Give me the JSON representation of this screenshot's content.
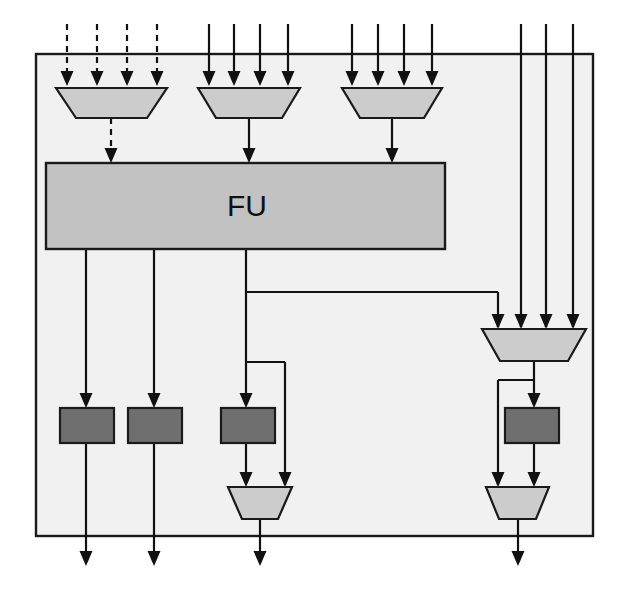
{
  "diagram": {
    "canvas": {
      "width": 626,
      "height": 590
    },
    "colors": {
      "background": "#ffffff",
      "frame_fill": "#f1f1f1",
      "frame_stroke": "#1a1a1a",
      "fu_fill": "#c2c2c2",
      "mux_fill": "#cccccc",
      "register_fill": "#6f6f6f",
      "wire": "#111111",
      "label_text": "#111111"
    },
    "frame": {
      "x": 36,
      "y": 54,
      "width": 557,
      "height": 482
    },
    "fu": {
      "label": "FU",
      "x": 46,
      "y": 163,
      "width": 399,
      "height": 86,
      "label_x": 247,
      "label_y": 208
    },
    "muxes": [
      {
        "name": "input-mux-1",
        "top_left": 56,
        "top_right": 167,
        "bottom_left": 76,
        "bottom_right": 147,
        "top_y": 88,
        "bottom_y": 118,
        "dashed": true,
        "inputs": [
          67,
          97,
          127,
          157
        ],
        "output_x": 111
      },
      {
        "name": "input-mux-2",
        "top_left": 198,
        "top_right": 300,
        "bottom_left": 216,
        "bottom_right": 282,
        "top_y": 88,
        "bottom_y": 118,
        "dashed": false,
        "inputs": [
          209,
          234,
          260,
          288
        ],
        "output_x": 249
      },
      {
        "name": "input-mux-3",
        "top_left": 342,
        "top_right": 442,
        "bottom_left": 360,
        "bottom_right": 424,
        "top_y": 88,
        "bottom_y": 118,
        "dashed": false,
        "inputs": [
          352,
          378,
          404,
          432
        ],
        "output_x": 392
      },
      {
        "name": "right-mux",
        "top_left": 482,
        "top_right": 586,
        "bottom_left": 500,
        "bottom_right": 568,
        "top_y": 329,
        "bottom_y": 361,
        "dashed": false,
        "inputs": [
          498,
          521,
          546,
          573
        ],
        "output_x": 534
      },
      {
        "name": "output-mux-center",
        "top_left": 228,
        "top_right": 292,
        "bottom_left": 242,
        "bottom_right": 278,
        "top_y": 487,
        "bottom_y": 519,
        "dashed": false,
        "inputs": [
          246,
          285
        ],
        "output_x": 260
      },
      {
        "name": "output-mux-right",
        "top_left": 486,
        "top_right": 549,
        "bottom_left": 499,
        "bottom_right": 536,
        "top_y": 487,
        "bottom_y": 519,
        "dashed": false,
        "inputs": [
          498,
          534
        ],
        "output_x": 518
      }
    ],
    "registers": [
      {
        "name": "register-1",
        "x": 60,
        "y": 408,
        "width": 54,
        "height": 35
      },
      {
        "name": "register-2",
        "x": 128,
        "y": 408,
        "width": 54,
        "height": 35
      },
      {
        "name": "register-3",
        "x": 221,
        "y": 408,
        "width": 54,
        "height": 35
      },
      {
        "name": "register-4",
        "x": 505,
        "y": 408,
        "width": 54,
        "height": 35
      }
    ],
    "top_inputs": {
      "dashed_group": {
        "xs": [
          67,
          97,
          127,
          157
        ],
        "start_y": 24,
        "end_y": 86
      },
      "solid_group_a": {
        "xs": [
          209,
          234,
          260,
          288
        ],
        "start_y": 24,
        "end_y": 86
      },
      "solid_group_b": {
        "xs": [
          352,
          378,
          404,
          432
        ],
        "start_y": 24,
        "end_y": 86
      },
      "bypass_lines": {
        "xs": [
          521,
          546,
          573
        ],
        "start_y": 24,
        "end_y": 327
      }
    },
    "fu_outputs": {
      "xs": [
        86,
        154,
        246
      ],
      "start_y": 249
    },
    "fu_branch_to_right_mux": {
      "from_x": 246,
      "at_y": 292,
      "to_x": 498,
      "drop_to_y": 327
    },
    "fu_branch_to_center_output_mux": {
      "from_x": 246,
      "at_y": 362,
      "to_x": 285,
      "drop_to_y": 485
    },
    "right_mux_branch": {
      "from_x": 534,
      "at_y": 380,
      "to_x": 498,
      "drop_to_y": 485
    },
    "bottom_outputs": {
      "xs": [
        86,
        154,
        260,
        518
      ],
      "exit_y": 536,
      "tip_y": 566
    }
  }
}
